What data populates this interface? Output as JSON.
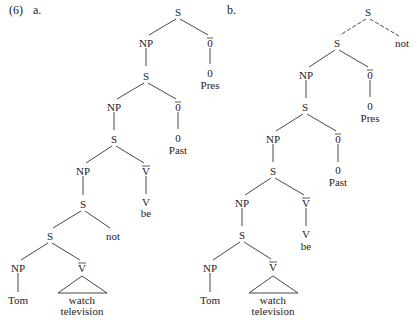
{
  "example": {
    "number": "(6)",
    "tree_a_label": "a.",
    "tree_b_label": "b."
  },
  "tree_a": {
    "root": "S",
    "n_np1": "NP",
    "n_obar1": "0",
    "n_zero1": "0",
    "n_pres": "Pres",
    "n_s1": "S",
    "n_np2": "NP",
    "n_obar2": "0",
    "n_zero2": "0",
    "n_past": "Past",
    "n_s2": "S",
    "n_np3": "NP",
    "n_vbar1": "V",
    "n_v": "V",
    "n_be": "be",
    "n_s3": "S",
    "n_s4": "S",
    "n_not": "not",
    "n_np4": "NP",
    "n_vbar2": "V",
    "n_tom": "Tom",
    "n_watch": "watch",
    "n_television": "television"
  },
  "tree_b": {
    "root": "S",
    "n_s0": "S",
    "n_not": "not",
    "n_np1": "NP",
    "n_obar1": "0",
    "n_zero1": "0",
    "n_pres": "Pres",
    "n_s1": "S",
    "n_np2": "NP",
    "n_obar2": "0",
    "n_zero2": "0",
    "n_past": "Past",
    "n_s2": "S",
    "n_np3": "NP",
    "n_vbar1": "V",
    "n_v": "V",
    "n_be": "be",
    "n_s3": "S",
    "n_np4": "NP",
    "n_vbar2": "V",
    "n_tom": "Tom",
    "n_watch": "watch",
    "n_television": "television"
  },
  "colors": {
    "ink": "#222222",
    "background": "#ffffff"
  }
}
